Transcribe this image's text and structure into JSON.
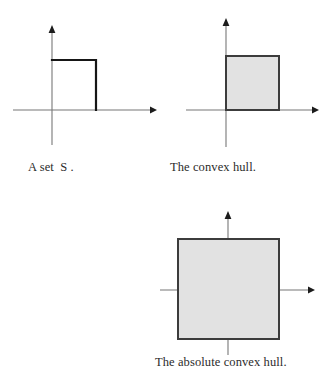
{
  "document": {
    "type": "mathematical-diagram",
    "background_color": "#ffffff",
    "ink_color": "#161616",
    "axis_color": "#777777",
    "fill_color": "#e2e2e2",
    "fill_border_color": "#3c3c3c"
  },
  "panels": [
    {
      "id": "set",
      "caption": "A set  S .",
      "shape_kind": "open-polyline",
      "description": "Two sides of a unit square: the top edge and the right edge, with the left edge lying along the y-axis.",
      "axes": {
        "x_axis": {
          "from": [
            13,
            110
          ],
          "to": [
            155,
            110
          ],
          "arrow": "right"
        },
        "y_axis": {
          "from": [
            52,
            145
          ],
          "to": [
            52,
            27
          ],
          "arrow": "up"
        },
        "origin": [
          52,
          110
        ]
      },
      "geometry": {
        "points": [
          [
            52,
            60
          ],
          [
            96,
            60
          ],
          [
            96,
            110
          ]
        ]
      }
    },
    {
      "id": "convex-hull",
      "caption": "The convex hull.",
      "shape_kind": "filled-rect",
      "description": "A filled square in the first quadrant whose left edge lies on the y-axis.",
      "axes": {
        "x_axis": {
          "from": [
            21,
            110
          ],
          "to": [
            152,
            110
          ],
          "arrow": "right"
        },
        "y_axis": {
          "from": [
            61,
            147
          ],
          "to": [
            61,
            20
          ],
          "arrow": "up"
        },
        "origin": [
          61,
          110
        ]
      },
      "geometry": {
        "rect": {
          "x": 61,
          "y": 56,
          "width": 53,
          "height": 54
        }
      }
    },
    {
      "id": "absolute-convex-hull",
      "caption": "The absolute convex hull.",
      "shape_kind": "filled-rect",
      "description": "A large filled square centred on the origin, symmetric about both axes.",
      "axes": {
        "x_axis": {
          "from": [
            20,
            100
          ],
          "to": [
            173,
            100
          ],
          "arrow": "right"
        },
        "y_axis": {
          "from": [
            88,
            165
          ],
          "to": [
            88,
            21
          ],
          "arrow": "up"
        },
        "origin": [
          88,
          100
        ]
      },
      "geometry": {
        "rect": {
          "x": 38,
          "y": 49,
          "width": 101,
          "height": 100
        }
      }
    }
  ],
  "captions": {
    "set": "A set  S .",
    "convex_hull": "The convex hull.",
    "absolute_convex_hull": "The absolute convex hull."
  }
}
